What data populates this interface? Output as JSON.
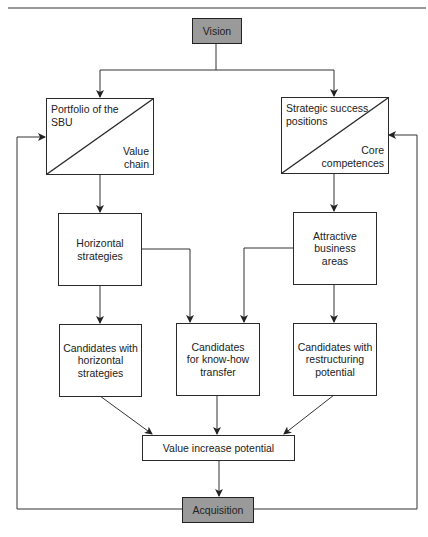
{
  "diagram": {
    "nodes": {
      "vision": {
        "label": "Vision"
      },
      "portfolio": {
        "top_label": "Portfolio of the\nSBU",
        "bottom_label": "Value\nchain"
      },
      "strategic": {
        "top_label": "Strategic success\npositions",
        "bottom_label": "Core\ncompetences"
      },
      "horizontal": {
        "label": "Horizontal\nstrategies"
      },
      "attractive": {
        "label": "Attractive\nbusiness\nareas"
      },
      "cand_horizontal": {
        "label": "Candidates with\nhorizontal\nstrategies"
      },
      "cand_knowhow": {
        "label": "Candidates\nfor know-how\ntransfer"
      },
      "cand_restructuring": {
        "label": "Candidates with\nrestructuring\npotential"
      },
      "value_increase": {
        "label": "Value increase potential"
      },
      "acquisition": {
        "label": "Acquisition"
      }
    },
    "edges": [
      {
        "from": "vision",
        "to": "portfolio"
      },
      {
        "from": "vision",
        "to": "strategic"
      },
      {
        "from": "portfolio",
        "to": "horizontal"
      },
      {
        "from": "strategic",
        "to": "attractive"
      },
      {
        "from": "horizontal",
        "to": "cand_horizontal"
      },
      {
        "from": "horizontal",
        "to": "cand_knowhow"
      },
      {
        "from": "attractive",
        "to": "cand_knowhow"
      },
      {
        "from": "attractive",
        "to": "cand_restructuring"
      },
      {
        "from": "cand_horizontal",
        "to": "value_increase"
      },
      {
        "from": "cand_knowhow",
        "to": "value_increase"
      },
      {
        "from": "cand_restructuring",
        "to": "value_increase"
      },
      {
        "from": "value_increase",
        "to": "acquisition"
      },
      {
        "from": "acquisition",
        "to": "portfolio",
        "type": "feedback"
      },
      {
        "from": "acquisition",
        "to": "strategic",
        "type": "feedback"
      }
    ],
    "colors": {
      "highlight_fill": "#9a9a9a",
      "line": "#2a2a2a"
    }
  }
}
